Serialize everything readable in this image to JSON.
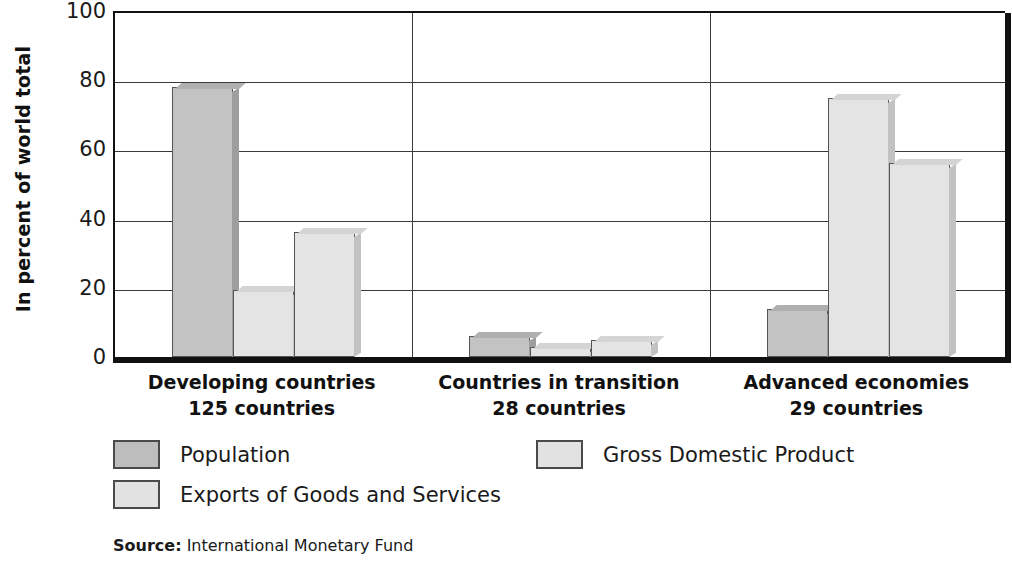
{
  "chart_data": {
    "type": "bar",
    "title": "",
    "xlabel": "",
    "ylabel": "In percent of world total",
    "ylim": [
      0,
      100
    ],
    "yticks": [
      0,
      20,
      40,
      60,
      80,
      100
    ],
    "grid": true,
    "legend_position": "bottom",
    "categories": [
      "Developing countries",
      "Countries in transition",
      "Advanced economies"
    ],
    "category_sublabels": [
      "125 countries",
      "28 countries",
      "29 countries"
    ],
    "series": [
      {
        "name": "Population",
        "color": "#c3c3c3",
        "values": [
          78,
          6,
          14
        ]
      },
      {
        "name": "Gross Domestic Product",
        "color": "#e4e4e4",
        "values": [
          19.5,
          3,
          75
        ]
      },
      {
        "name": "Exports of Goods and Services",
        "color": "#e4e4e4",
        "values": [
          36,
          5,
          56
        ]
      }
    ]
  },
  "legend": {
    "items": [
      {
        "label": "Population",
        "swatch": "dark"
      },
      {
        "label": "Gross Domestic Product",
        "swatch": "light"
      },
      {
        "label": "Exports of Goods and Services",
        "swatch": "light"
      }
    ]
  },
  "source": {
    "label": "Source:",
    "value": "International Monetary Fund"
  }
}
